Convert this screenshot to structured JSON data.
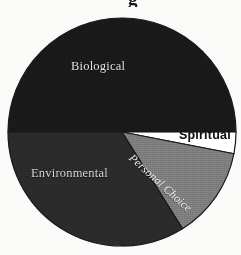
{
  "figure": {
    "background": "#fbfbfa",
    "title_remnant": "g",
    "note": "scanned greyscale pie chart"
  },
  "chart_data": {
    "type": "pie",
    "title": "",
    "subtitle": "",
    "xlabel": "",
    "ylabel": "",
    "legend": "none",
    "grid": false,
    "labels_inside": true,
    "start_angle_deg": 180,
    "direction": "clockwise",
    "center": {
      "x": 122,
      "y": 132
    },
    "radius": 114,
    "categories": [
      "Biological",
      "Spiritual",
      "Personal Choice",
      "Environmental"
    ],
    "values": [
      50,
      3,
      13,
      34
    ],
    "unit": "percent",
    "slices": [
      {
        "label": "Biological",
        "value": 50,
        "start_deg": 180,
        "end_deg": 360,
        "color": "#1b1b1b",
        "label_color": "#e8e8e6",
        "label_style": "normal"
      },
      {
        "label": "Spiritual",
        "value": 3,
        "start_deg": 0,
        "end_deg": 11,
        "color": "#ffffff",
        "label_color": "#111111",
        "label_style": "bold"
      },
      {
        "label": "Personal Choice",
        "value": 13,
        "start_deg": 11,
        "end_deg": 58,
        "color": "#878787",
        "label_color": "#f2f2f0",
        "label_style": "italic-rotated"
      },
      {
        "label": "Environmental",
        "value": 34,
        "start_deg": 58,
        "end_deg": 180,
        "color": "#2e2e2e",
        "label_color": "#dcdcda",
        "label_style": "normal"
      }
    ],
    "outline_color": "#1b1b1b"
  }
}
